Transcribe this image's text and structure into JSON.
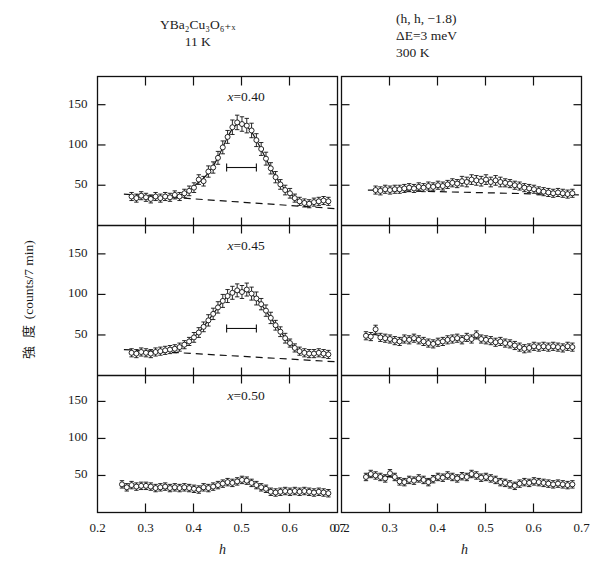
{
  "header": {
    "left_title": "YBa2Cu3O6+x",
    "left_title_html": "YBa₂Cu₃O₆₊ₓ",
    "left_temperature": "11 K",
    "right_line1": "(h, h, −1.8)",
    "right_line2": "ΔE=3 meV",
    "right_temperature": "300 K"
  },
  "axes": {
    "ylabel": "強 度 (counts/7 min)",
    "ylabel_jp": "強 度",
    "ylabel_unit": "(counts/7 min)",
    "xlabel": "h",
    "xticks": [
      "0.2",
      "0.3",
      "0.4",
      "0.5",
      "0.6",
      "0.7"
    ],
    "xtick_values": [
      0.2,
      0.3,
      0.4,
      0.5,
      0.6,
      0.7
    ],
    "yticks": [
      "50",
      "100",
      "150"
    ],
    "ytick_values": [
      50,
      100,
      150
    ],
    "xlim": [
      0.2,
      0.7
    ],
    "ylim": [
      0,
      185
    ]
  },
  "panel_tags": {
    "p1": "x=0.40",
    "p2": "x=0.45",
    "p3": "x=0.50"
  },
  "chart_data": {
    "type": "scatter",
    "xlabel": "h",
    "ylabel": "強度 (counts/7 min)",
    "xlim": [
      0.2,
      0.7
    ],
    "ylim": [
      0,
      185
    ],
    "grid": false,
    "legend": "none",
    "columns": [
      {
        "name": "11 K",
        "temperature": "11 K"
      },
      {
        "name": "300 K",
        "temperature": "300 K"
      }
    ],
    "scan_condition": "(h, h, -1.8)  ΔE = 3 meV",
    "panels": [
      {
        "id": "x040-11K",
        "tag": "x=0.40",
        "column": "11 K",
        "x": [
          0.271,
          0.281,
          0.291,
          0.301,
          0.311,
          0.321,
          0.331,
          0.341,
          0.351,
          0.361,
          0.371,
          0.381,
          0.391,
          0.401,
          0.411,
          0.421,
          0.431,
          0.441,
          0.451,
          0.461,
          0.471,
          0.481,
          0.491,
          0.501,
          0.511,
          0.521,
          0.531,
          0.541,
          0.551,
          0.561,
          0.571,
          0.581,
          0.591,
          0.601,
          0.611,
          0.621,
          0.631,
          0.641,
          0.651,
          0.661,
          0.671,
          0.681
        ],
        "y": [
          36,
          34,
          37,
          35,
          33,
          36,
          34,
          36,
          35,
          38,
          36,
          40,
          43,
          47,
          57,
          55,
          67,
          72,
          84,
          97,
          110,
          122,
          128,
          126,
          124,
          118,
          106,
          95,
          83,
          71,
          60,
          51,
          44,
          40,
          34,
          30,
          28,
          27,
          29,
          30,
          31,
          30
        ],
        "yerr": [
          5,
          5,
          5,
          5,
          5,
          5,
          5,
          5,
          5,
          5,
          5,
          5,
          6,
          6,
          6,
          6,
          7,
          7,
          8,
          8,
          8,
          9,
          9,
          9,
          9,
          9,
          8,
          8,
          8,
          7,
          7,
          6,
          6,
          6,
          5,
          5,
          5,
          5,
          5,
          5,
          5,
          5
        ],
        "background_line": {
          "type": "dashed",
          "x": [
            0.255,
            0.695
          ],
          "y": [
            39,
            21
          ]
        },
        "resolution_bar": {
          "x_center": 0.5,
          "x_half_width": 0.031,
          "y": 72
        },
        "peak": {
          "center": 0.5,
          "height": 128,
          "baseline": 33
        }
      },
      {
        "id": "x045-11K",
        "tag": "x=0.45",
        "column": "11 K",
        "x": [
          0.271,
          0.281,
          0.291,
          0.301,
          0.311,
          0.321,
          0.331,
          0.341,
          0.351,
          0.361,
          0.371,
          0.381,
          0.391,
          0.401,
          0.411,
          0.421,
          0.431,
          0.441,
          0.451,
          0.461,
          0.471,
          0.481,
          0.491,
          0.501,
          0.511,
          0.521,
          0.531,
          0.541,
          0.551,
          0.561,
          0.571,
          0.581,
          0.591,
          0.601,
          0.611,
          0.621,
          0.631,
          0.641,
          0.651,
          0.661,
          0.671,
          0.681
        ],
        "y": [
          28,
          27,
          29,
          28,
          27,
          29,
          30,
          31,
          32,
          33,
          35,
          38,
          42,
          47,
          53,
          60,
          68,
          76,
          84,
          92,
          98,
          102,
          105,
          103,
          106,
          101,
          95,
          88,
          80,
          71,
          62,
          54,
          46,
          40,
          34,
          30,
          28,
          27,
          27,
          28,
          27,
          26
        ],
        "yerr": [
          5,
          5,
          5,
          5,
          5,
          5,
          5,
          5,
          5,
          5,
          5,
          5,
          5,
          6,
          6,
          6,
          7,
          7,
          7,
          8,
          8,
          8,
          8,
          8,
          8,
          8,
          8,
          7,
          7,
          7,
          6,
          6,
          6,
          5,
          5,
          5,
          5,
          5,
          5,
          5,
          5,
          5
        ],
        "background_line": {
          "type": "dashed",
          "x": [
            0.255,
            0.695
          ],
          "y": [
            32,
            17
          ]
        },
        "resolution_bar": {
          "x_center": 0.5,
          "x_half_width": 0.031,
          "y": 58
        },
        "peak": {
          "center": 0.5,
          "height": 105,
          "baseline": 27
        }
      },
      {
        "id": "x050-11K",
        "tag": "x=0.50",
        "column": "11 K",
        "x": [
          0.251,
          0.261,
          0.271,
          0.281,
          0.291,
          0.301,
          0.311,
          0.321,
          0.331,
          0.341,
          0.351,
          0.361,
          0.371,
          0.381,
          0.391,
          0.401,
          0.411,
          0.421,
          0.431,
          0.441,
          0.451,
          0.461,
          0.471,
          0.481,
          0.491,
          0.501,
          0.511,
          0.521,
          0.531,
          0.541,
          0.551,
          0.561,
          0.571,
          0.581,
          0.591,
          0.601,
          0.611,
          0.621,
          0.631,
          0.641,
          0.651,
          0.661,
          0.671,
          0.681
        ],
        "y": [
          38,
          34,
          37,
          35,
          36,
          36,
          35,
          33,
          34,
          35,
          33,
          34,
          33,
          34,
          33,
          32,
          31,
          34,
          33,
          35,
          37,
          39,
          41,
          40,
          42,
          44,
          43,
          40,
          37,
          34,
          32,
          28,
          27,
          28,
          29,
          28,
          29,
          28,
          29,
          28,
          27,
          28,
          27,
          26
        ],
        "yerr": [
          5,
          5,
          5,
          5,
          5,
          5,
          5,
          5,
          5,
          5,
          5,
          5,
          5,
          5,
          5,
          5,
          5,
          5,
          5,
          5,
          5,
          5,
          5,
          5,
          5,
          5,
          5,
          5,
          5,
          5,
          5,
          5,
          5,
          5,
          5,
          5,
          5,
          5,
          5,
          5,
          5,
          5,
          5,
          5
        ],
        "background_line": null,
        "resolution_bar": null,
        "peak": {
          "center": 0.5,
          "height": 44,
          "baseline": 33
        }
      },
      {
        "id": "x040-300K",
        "tag": "x=0.40",
        "column": "300 K",
        "x": [
          0.271,
          0.281,
          0.291,
          0.301,
          0.311,
          0.321,
          0.331,
          0.341,
          0.351,
          0.361,
          0.371,
          0.381,
          0.391,
          0.401,
          0.411,
          0.421,
          0.431,
          0.441,
          0.451,
          0.461,
          0.471,
          0.481,
          0.491,
          0.501,
          0.511,
          0.521,
          0.531,
          0.541,
          0.551,
          0.561,
          0.571,
          0.581,
          0.591,
          0.601,
          0.611,
          0.621,
          0.631,
          0.641,
          0.651,
          0.661,
          0.671,
          0.681
        ],
        "y": [
          44,
          43,
          45,
          44,
          45,
          45,
          46,
          47,
          46,
          48,
          47,
          49,
          48,
          50,
          49,
          51,
          53,
          52,
          55,
          54,
          57,
          56,
          55,
          57,
          54,
          56,
          54,
          53,
          52,
          50,
          49,
          47,
          46,
          45,
          43,
          42,
          41,
          40,
          41,
          40,
          39,
          40
        ],
        "yerr": [
          5,
          5,
          5,
          5,
          5,
          5,
          5,
          5,
          5,
          5,
          5,
          5,
          5,
          5,
          5,
          5,
          5,
          5,
          6,
          6,
          6,
          6,
          6,
          6,
          6,
          6,
          6,
          5,
          5,
          5,
          5,
          5,
          5,
          5,
          5,
          5,
          5,
          5,
          5,
          5,
          5,
          5
        ],
        "background_line": {
          "type": "dashed",
          "x": [
            0.255,
            0.695
          ],
          "y": [
            44,
            38
          ]
        },
        "resolution_bar": null,
        "peak": {
          "center": 0.5,
          "height": 57,
          "baseline": 43
        }
      },
      {
        "id": "x045-300K",
        "tag": "x=0.45",
        "column": "300 K",
        "x": [
          0.251,
          0.261,
          0.271,
          0.281,
          0.291,
          0.301,
          0.311,
          0.321,
          0.331,
          0.341,
          0.351,
          0.361,
          0.371,
          0.381,
          0.391,
          0.401,
          0.411,
          0.421,
          0.431,
          0.441,
          0.451,
          0.461,
          0.471,
          0.481,
          0.491,
          0.501,
          0.511,
          0.521,
          0.531,
          0.541,
          0.551,
          0.561,
          0.571,
          0.581,
          0.591,
          0.601,
          0.611,
          0.621,
          0.631,
          0.641,
          0.651,
          0.661,
          0.671,
          0.681
        ],
        "y": [
          49,
          48,
          57,
          47,
          46,
          45,
          43,
          42,
          45,
          44,
          46,
          44,
          42,
          40,
          39,
          41,
          42,
          44,
          45,
          46,
          44,
          47,
          45,
          50,
          45,
          44,
          43,
          41,
          42,
          40,
          39,
          37,
          35,
          33,
          34,
          36,
          35,
          36,
          35,
          36,
          35,
          34,
          36,
          35
        ],
        "yerr": [
          5,
          5,
          5,
          5,
          5,
          5,
          5,
          5,
          5,
          5,
          5,
          5,
          5,
          5,
          5,
          5,
          5,
          5,
          5,
          5,
          5,
          5,
          5,
          5,
          5,
          5,
          5,
          5,
          5,
          5,
          5,
          5,
          5,
          5,
          5,
          5,
          5,
          5,
          5,
          5,
          5,
          5,
          5,
          5
        ],
        "background_line": null,
        "resolution_bar": null,
        "peak": {
          "center": 0.5,
          "height": 50,
          "baseline": 42
        }
      },
      {
        "id": "x050-300K",
        "tag": "x=0.50",
        "column": "300 K",
        "x": [
          0.251,
          0.261,
          0.271,
          0.281,
          0.291,
          0.301,
          0.311,
          0.321,
          0.331,
          0.341,
          0.351,
          0.361,
          0.371,
          0.381,
          0.391,
          0.401,
          0.411,
          0.421,
          0.431,
          0.441,
          0.451,
          0.461,
          0.471,
          0.481,
          0.491,
          0.501,
          0.511,
          0.521,
          0.531,
          0.541,
          0.551,
          0.561,
          0.571,
          0.581,
          0.591,
          0.601,
          0.611,
          0.621,
          0.631,
          0.641,
          0.651,
          0.661,
          0.671,
          0.681
        ],
        "y": [
          48,
          52,
          50,
          48,
          46,
          53,
          48,
          42,
          41,
          44,
          43,
          46,
          44,
          41,
          45,
          48,
          47,
          50,
          48,
          46,
          49,
          48,
          52,
          50,
          47,
          48,
          46,
          44,
          41,
          40,
          38,
          36,
          39,
          41,
          40,
          42,
          41,
          40,
          39,
          38,
          39,
          38,
          37,
          38
        ],
        "yerr": [
          5,
          5,
          5,
          5,
          5,
          5,
          5,
          5,
          5,
          5,
          5,
          5,
          5,
          5,
          5,
          5,
          5,
          5,
          5,
          5,
          5,
          5,
          5,
          5,
          5,
          5,
          5,
          5,
          5,
          5,
          5,
          5,
          5,
          5,
          5,
          5,
          5,
          5,
          5,
          5,
          5,
          5,
          5,
          5
        ],
        "background_line": null,
        "resolution_bar": null,
        "peak": {
          "center": 0.5,
          "height": 50,
          "baseline": 45
        }
      }
    ]
  }
}
